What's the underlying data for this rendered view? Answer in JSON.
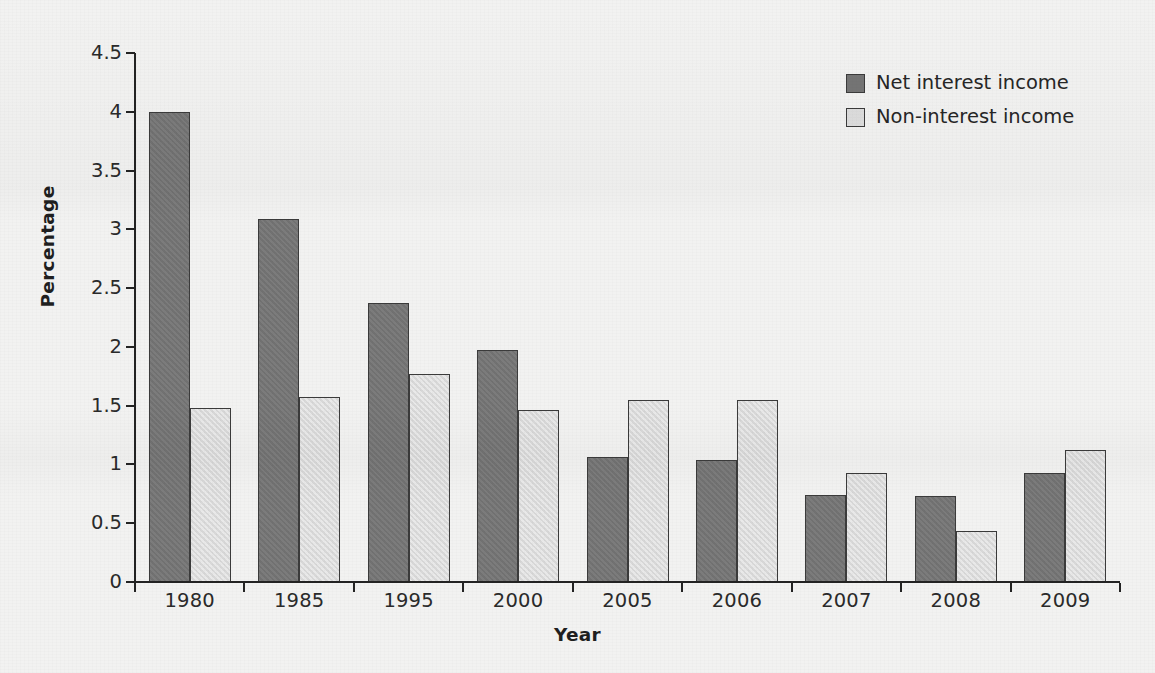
{
  "chart_data": {
    "type": "bar",
    "title": "",
    "xlabel": "Year",
    "ylabel": "Percentage",
    "categories": [
      "1980",
      "1985",
      "1995",
      "2000",
      "2005",
      "2006",
      "2007",
      "2008",
      "2009"
    ],
    "series": [
      {
        "name": "Net interest income",
        "color": "#757575",
        "values": [
          4.0,
          3.09,
          2.37,
          1.97,
          1.06,
          1.04,
          0.74,
          0.73,
          0.93
        ]
      },
      {
        "name": "Non-interest income",
        "color": "#dddddd",
        "values": [
          1.48,
          1.57,
          1.77,
          1.46,
          1.55,
          1.55,
          0.93,
          0.43,
          1.12
        ]
      }
    ],
    "ylim": [
      0,
      4.5
    ],
    "yticks": [
      "0",
      "0.5",
      "1",
      "1.5",
      "2",
      "2.5",
      "3",
      "3.5",
      "4",
      "4.5"
    ],
    "ytick_values": [
      0,
      0.5,
      1,
      1.5,
      2,
      2.5,
      3,
      3.5,
      4,
      4.5
    ],
    "grid": false,
    "legend_position": "top-right"
  },
  "legend": {
    "items": [
      {
        "label": "Net interest income",
        "swatch": "dark"
      },
      {
        "label": "Non-interest income",
        "swatch": "light"
      }
    ]
  },
  "colors": {
    "background": "#f2f2f1",
    "axis": "#232323",
    "bar_dark": "#757575",
    "bar_light": "#dddddd",
    "bar_edge": "#3b3b3b",
    "text": "#2a2a2a"
  }
}
